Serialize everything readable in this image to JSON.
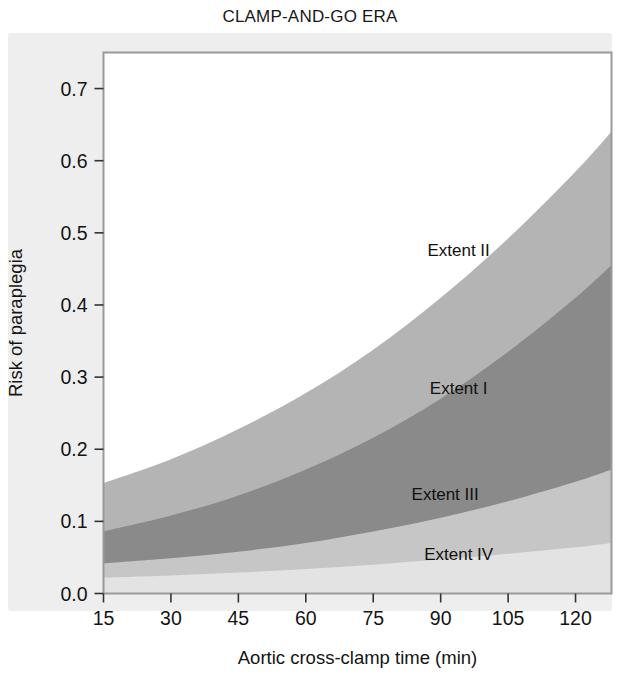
{
  "chart_data": {
    "type": "area",
    "title": "CLAMP-AND-GO ERA",
    "xlabel": "Aortic cross-clamp time (min)",
    "ylabel": "Risk of paraplegia",
    "xlim": [
      15,
      128
    ],
    "ylim": [
      0.0,
      0.75
    ],
    "grid": false,
    "legend_position": "inline-band-labels",
    "xticks": [
      15,
      30,
      45,
      60,
      75,
      90,
      105,
      120
    ],
    "xtick_labels": [
      "15",
      "30",
      "45",
      "60",
      "75",
      "90",
      "105",
      "120"
    ],
    "yticks": [
      0.0,
      0.1,
      0.2,
      0.3,
      0.4,
      0.5,
      0.6,
      0.7
    ],
    "ytick_labels": [
      "0.0",
      "0.1",
      "0.2",
      "0.3",
      "0.4",
      "0.5",
      "0.6",
      "0.7"
    ],
    "x": [
      15,
      30,
      45,
      60,
      75,
      90,
      105,
      120,
      128
    ],
    "series": [
      {
        "name": "Extent IV",
        "label": "Extent IV",
        "color": "#e3e3e3",
        "stack_order": 1,
        "cumulative_upper": [
          0.022,
          0.025,
          0.029,
          0.034,
          0.04,
          0.047,
          0.055,
          0.064,
          0.07
        ],
        "baseline": [
          0.0,
          0.0,
          0.0,
          0.0,
          0.0,
          0.0,
          0.0,
          0.0,
          0.0
        ],
        "label_x": 94,
        "label_y": 0.047
      },
      {
        "name": "Extent III",
        "label": "Extent III",
        "color": "#c6c6c6",
        "stack_order": 2,
        "cumulative_upper": [
          0.042,
          0.049,
          0.058,
          0.07,
          0.086,
          0.105,
          0.128,
          0.155,
          0.172
        ],
        "label_x": 91,
        "label_y": 0.13
      },
      {
        "name": "Extent I",
        "label": "Extent I",
        "color": "#8a8a8a",
        "stack_order": 3,
        "cumulative_upper": [
          0.086,
          0.108,
          0.136,
          0.172,
          0.216,
          0.27,
          0.335,
          0.41,
          0.455
        ],
        "label_x": 94,
        "label_y": 0.277
      },
      {
        "name": "Extent II",
        "label": "Extent II",
        "color": "#b4b4b4",
        "stack_order": 4,
        "cumulative_upper": [
          0.153,
          0.186,
          0.228,
          0.278,
          0.338,
          0.41,
          0.492,
          0.585,
          0.64
        ],
        "label_x": 94,
        "label_y": 0.468
      }
    ]
  },
  "figure": {
    "title": "CLAMP-AND-GO ERA",
    "panel_background": "#eeeeee",
    "plot_background": "#ffffff",
    "frame_color": "#9a9a9a"
  }
}
